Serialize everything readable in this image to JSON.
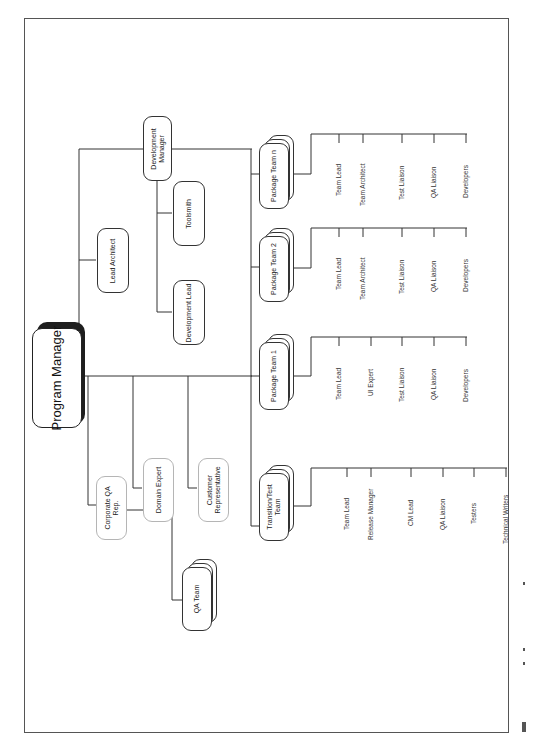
{
  "figure": {
    "frame_color": "#555555",
    "line_color": "#333333",
    "faint_box_color": "#b5b5b5",
    "orientation": "rotated-90-ccw"
  },
  "root": {
    "label": "Program Manager"
  },
  "development": {
    "manager": {
      "label_line1": "Development",
      "label_line2": "Manager"
    },
    "lead_architect": {
      "label": "Lead Architect"
    },
    "toolsmith": {
      "label": "Toolsmith"
    },
    "development_lead": {
      "label": "Development Lead"
    }
  },
  "staff": {
    "corporate_qa": {
      "label_line1": "Corporate QA",
      "label_line2": "Rep."
    },
    "domain_expert": {
      "label": "Domain Expert"
    },
    "customer_rep": {
      "label_line1": "Customer",
      "label_line2": "Representative"
    },
    "qa_team": {
      "label": "QA Team"
    }
  },
  "teams": [
    {
      "label_line1": "Package Team n",
      "label_line2": "",
      "roles": [
        "Team Lead",
        "Team Architect",
        "Test Liaison",
        "QA Liaison",
        "Developers"
      ]
    },
    {
      "label_line1": "Package Team 2",
      "label_line2": "",
      "roles": [
        "Team Lead",
        "Team Architect",
        "Test Liaison",
        "QA Liaison",
        "Developers"
      ]
    },
    {
      "label_line1": "Package Team 1",
      "label_line2": "",
      "roles": [
        "Team Lead",
        "UI Expert",
        "Test Liaison",
        "QA Liaison",
        "Developers"
      ]
    },
    {
      "label_line1": "Transition/Test",
      "label_line2": "Team",
      "roles": [
        "Team Lead",
        "Release Manager",
        "CM Lead",
        "QA Liaison",
        "Testers",
        "Technical Writers"
      ]
    }
  ]
}
